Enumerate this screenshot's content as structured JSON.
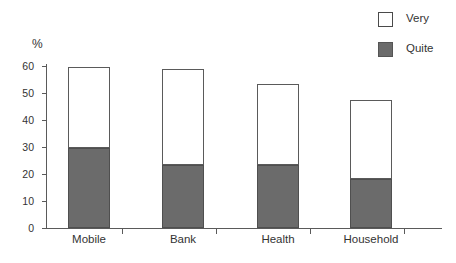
{
  "chart_data": {
    "type": "bar",
    "subtype": "stacked-bar",
    "title": "",
    "xlabel": "",
    "ylabel": "%",
    "ylim": [
      0,
      60
    ],
    "yticks": [
      0,
      10,
      20,
      30,
      40,
      50,
      60
    ],
    "grid": false,
    "legend_position": "top-right",
    "categories": [
      "Mobile",
      "Bank",
      "Health",
      "Household"
    ],
    "series": [
      {
        "name": "Quite",
        "color": "#6b6b6b",
        "values": [
          29.5,
          23.5,
          23.3,
          18.0
        ]
      },
      {
        "name": "Very",
        "color": "#ffffff",
        "values": [
          30.0,
          35.5,
          30.0,
          29.4
        ]
      }
    ],
    "totals": [
      59.5,
      59.0,
      53.3,
      47.4
    ]
  },
  "legend": {
    "items": [
      {
        "label": "Very",
        "swatch": "white-square-icon"
      },
      {
        "label": "Quite",
        "swatch": "gray-square-icon"
      }
    ]
  },
  "axis": {
    "y_title": "%",
    "tick_labels": [
      "60",
      "50",
      "40",
      "30",
      "20",
      "10",
      "0"
    ]
  }
}
